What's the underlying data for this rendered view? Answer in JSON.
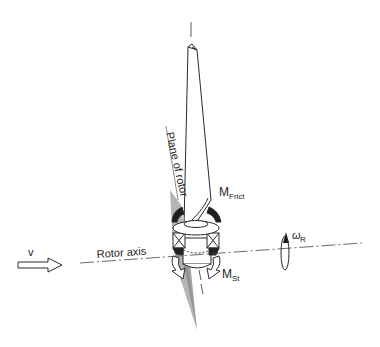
{
  "figure": {
    "labels": {
      "wind_velocity": "v",
      "rotor_axis": "Rotor axis",
      "plane_of_rotor": "Plane of rotor",
      "friction_moment_main": "M",
      "friction_moment_sub": "Frict",
      "steering_moment_main": "M",
      "steering_moment_sub": "St",
      "rotor_speed_main": "ω",
      "rotor_speed_sub": "R"
    },
    "colors": {
      "line": "#2a2a2a",
      "shade": "#9a9a9a",
      "background": "#ffffff"
    }
  }
}
